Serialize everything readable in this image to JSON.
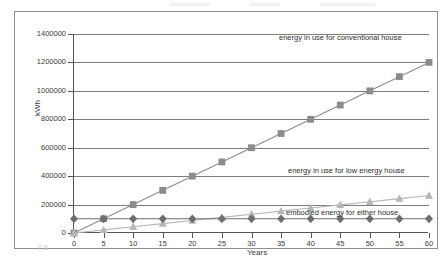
{
  "figure": {
    "number": "7.6"
  },
  "chart_data": {
    "type": "line",
    "title": "",
    "xlabel": "Years",
    "ylabel": "kWh",
    "xlim": [
      0,
      60
    ],
    "ylim": [
      0,
      1400000
    ],
    "xticks": [
      0,
      5,
      10,
      15,
      20,
      25,
      30,
      35,
      40,
      45,
      50,
      55,
      60
    ],
    "yticks": [
      0,
      200000,
      400000,
      600000,
      800000,
      1000000,
      1200000,
      1400000
    ],
    "ytick_labels": [
      "0",
      "200000",
      "400000",
      "600000",
      "800000",
      "1000000",
      "1200000",
      "1400000"
    ],
    "grid": true,
    "legend_position": "inline-annotations",
    "x": [
      0,
      5,
      10,
      15,
      20,
      25,
      30,
      35,
      40,
      45,
      50,
      55,
      60
    ],
    "series": [
      {
        "name": "energy in use for conventional house",
        "marker": "square",
        "color": "#8c8c8c",
        "values": [
          0,
          100000,
          200000,
          300000,
          400000,
          500000,
          600000,
          700000,
          800000,
          900000,
          1000000,
          1100000,
          1200000
        ]
      },
      {
        "name": "energy in use for low energy house",
        "marker": "triangle",
        "color": "#b7b7b7",
        "values": [
          0,
          22000,
          44000,
          66000,
          88000,
          110000,
          132000,
          154000,
          176000,
          198000,
          220000,
          242000,
          264000
        ]
      },
      {
        "name": "embodied energy for either house",
        "marker": "diamond",
        "color": "#6e6e6e",
        "values": [
          100000,
          100000,
          100000,
          100000,
          100000,
          100000,
          100000,
          100000,
          100000,
          100000,
          100000,
          100000,
          100000
        ]
      }
    ],
    "annotations": [
      {
        "text": "energy in use for conventional house",
        "x_px": 278,
        "y_px": 33
      },
      {
        "text": "energy in use for low energy house",
        "x_px": 287,
        "y_px": 166
      },
      {
        "text": "embodied energy for either house",
        "x_px": 285,
        "y_px": 208
      }
    ]
  }
}
